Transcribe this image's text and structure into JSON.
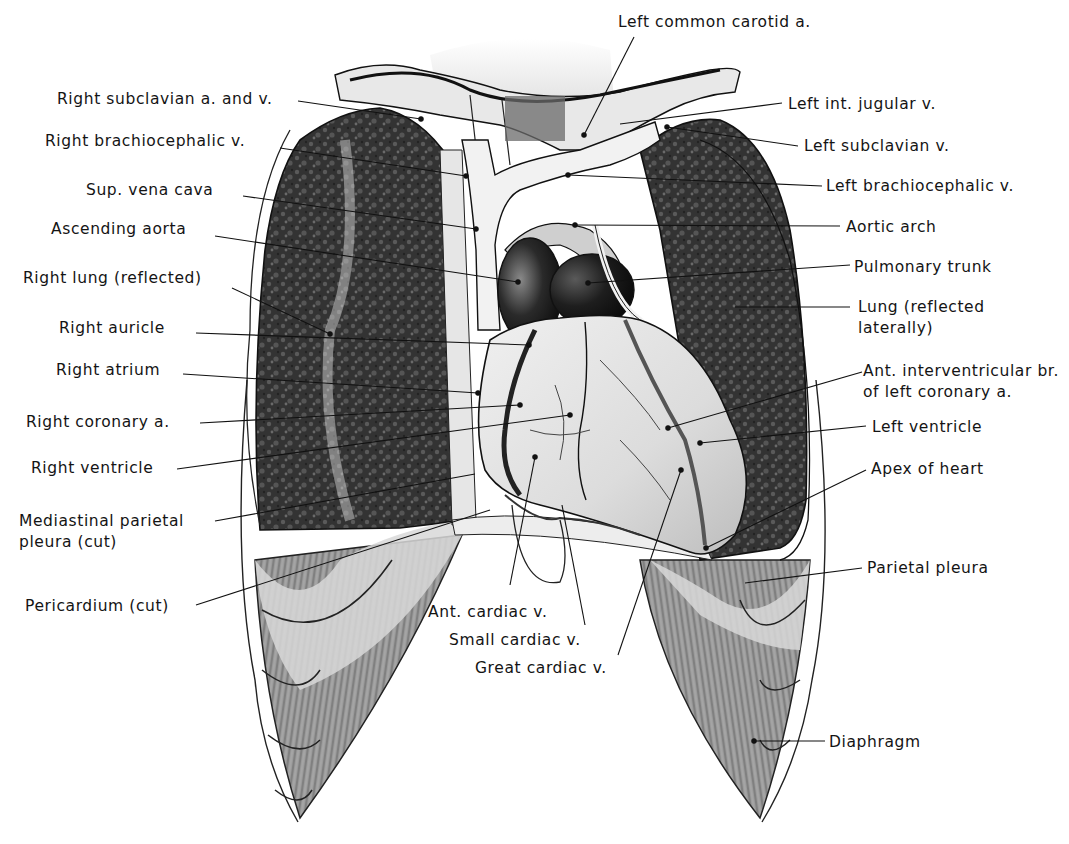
{
  "figure": {
    "colors": {
      "background": "#ffffff",
      "ink": "#141414",
      "lung_dark": "#2b2b2b",
      "lung_mid": "#4a4a4a",
      "vessel_light": "#ececec",
      "heart_light": "#e4e4e4",
      "aorta_dark": "#1a1a1a",
      "diaphragm": "#8a8a8a",
      "pleura": "#d4d4d4"
    }
  },
  "labels": {
    "left": [
      {
        "id": "right-subclavian",
        "text": "Right subclavian a. and v."
      },
      {
        "id": "right-brachiocephalic",
        "text": "Right brachiocephalic v."
      },
      {
        "id": "sup-vena-cava",
        "text": "Sup. vena cava"
      },
      {
        "id": "ascending-aorta",
        "text": "Ascending aorta"
      },
      {
        "id": "right-lung",
        "text": "Right lung (reflected)"
      },
      {
        "id": "right-auricle",
        "text": "Right auricle"
      },
      {
        "id": "right-atrium",
        "text": "Right atrium"
      },
      {
        "id": "right-coronary",
        "text": "Right coronary a."
      },
      {
        "id": "right-ventricle",
        "text": "Right ventricle"
      },
      {
        "id": "mediastinal-pleura",
        "text": "Mediastinal parietal\npleura (cut)"
      },
      {
        "id": "pericardium",
        "text": "Pericardium (cut)"
      }
    ],
    "right": [
      {
        "id": "left-common-carotid",
        "text": "Left common carotid a."
      },
      {
        "id": "left-int-jugular",
        "text": "Left int. jugular v."
      },
      {
        "id": "left-subclavian",
        "text": "Left subclavian v."
      },
      {
        "id": "left-brachiocephalic",
        "text": "Left brachiocephalic v."
      },
      {
        "id": "aortic-arch",
        "text": "Aortic arch"
      },
      {
        "id": "pulmonary-trunk",
        "text": "Pulmonary trunk"
      },
      {
        "id": "lung-reflected",
        "text": "Lung (reflected\nlaterally)"
      },
      {
        "id": "ant-interventricular",
        "text": "Ant. interventricular br.\nof left coronary a."
      },
      {
        "id": "left-ventricle",
        "text": "Left ventricle"
      },
      {
        "id": "apex",
        "text": "Apex of heart"
      },
      {
        "id": "parietal-pleura",
        "text": "Parietal pleura"
      },
      {
        "id": "diaphragm",
        "text": "Diaphragm"
      }
    ],
    "bottom": [
      {
        "id": "ant-cardiac",
        "text": "Ant. cardiac v."
      },
      {
        "id": "small-cardiac",
        "text": "Small cardiac v."
      },
      {
        "id": "great-cardiac",
        "text": "Great cardiac v."
      }
    ]
  }
}
